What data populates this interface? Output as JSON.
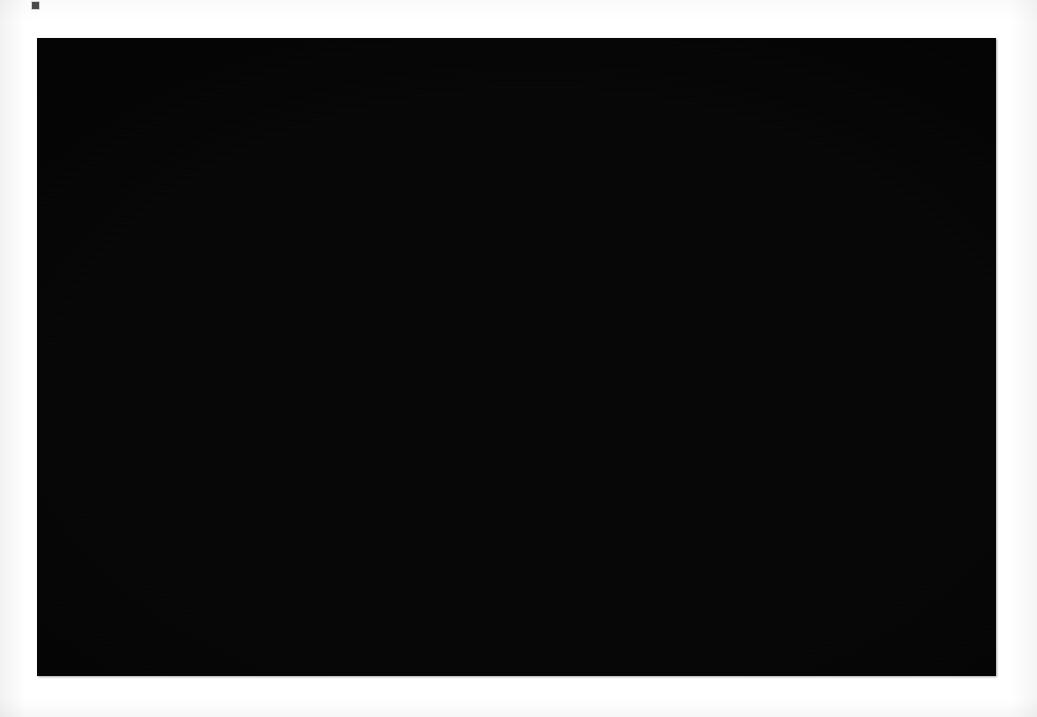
{
  "figure": {
    "domain": "chart",
    "kind": "3d-network-flow-map",
    "caption": "",
    "panel": {
      "background_color": "#050505",
      "page_background_color": "#ffffff",
      "left": 37,
      "top": 38,
      "width": 959,
      "height": 638
    },
    "palette": {
      "background": "#050505",
      "landmass_top": "#1d1d1d",
      "landmass_side_light": "#e6e6e6",
      "landmass_side_mid": "#b4b4b4",
      "landmass_side_dark": "#6e6e6e",
      "arc_bright": "#f2f2f2",
      "arc_mid": "#b8b8b8",
      "arc_faint": "#7a7a7a",
      "node_city": "#ffffff",
      "node_apex": "#9a9a9a"
    },
    "elements": {
      "basemap_label": "Extruded 3D map of the United States (lower 48, Alaska, Hawaii)",
      "spikes_label": "Vertical hub spikes rising from major cities",
      "arcs_label": "Top-level arcs connecting hub apexes",
      "ground_links_label": "Ground-level links between city nodes",
      "cities_label": "City node markers"
    }
  },
  "chart_data": {
    "type": "scatter",
    "title": "",
    "subtitle": "",
    "xlabel": "",
    "ylabel": "",
    "legend": [],
    "grid": false,
    "projection": "isometric-3d, viewed from above-south, vertical axis = traffic volume",
    "landmass_outline_conus": [
      [
        265,
        393
      ],
      [
        282,
        387
      ],
      [
        300,
        383
      ],
      [
        322,
        381
      ],
      [
        348,
        379
      ],
      [
        372,
        377
      ],
      [
        400,
        374
      ],
      [
        432,
        371
      ],
      [
        468,
        367
      ],
      [
        505,
        364
      ],
      [
        548,
        361
      ],
      [
        592,
        358
      ],
      [
        636,
        356
      ],
      [
        678,
        354
      ],
      [
        716,
        353
      ],
      [
        752,
        352
      ],
      [
        786,
        352
      ],
      [
        818,
        354
      ],
      [
        846,
        358
      ],
      [
        872,
        364
      ],
      [
        894,
        372
      ],
      [
        912,
        382
      ],
      [
        924,
        393
      ],
      [
        930,
        404
      ],
      [
        934,
        416
      ],
      [
        930,
        428
      ],
      [
        921,
        438
      ],
      [
        910,
        447
      ],
      [
        898,
        455
      ],
      [
        886,
        462
      ],
      [
        874,
        468
      ],
      [
        862,
        474
      ],
      [
        852,
        480
      ],
      [
        845,
        489
      ],
      [
        840,
        500
      ],
      [
        836,
        512
      ],
      [
        832,
        524
      ],
      [
        826,
        536
      ],
      [
        818,
        546
      ],
      [
        808,
        553
      ],
      [
        796,
        559
      ],
      [
        786,
        567
      ],
      [
        780,
        578
      ],
      [
        776,
        592
      ],
      [
        772,
        606
      ],
      [
        766,
        618
      ],
      [
        758,
        626
      ],
      [
        748,
        628
      ],
      [
        740,
        620
      ],
      [
        736,
        606
      ],
      [
        734,
        590
      ],
      [
        730,
        574
      ],
      [
        724,
        560
      ],
      [
        716,
        548
      ],
      [
        706,
        538
      ],
      [
        694,
        530
      ],
      [
        680,
        524
      ],
      [
        664,
        520
      ],
      [
        648,
        518
      ],
      [
        632,
        518
      ],
      [
        616,
        520
      ],
      [
        600,
        523
      ],
      [
        586,
        527
      ],
      [
        572,
        530
      ],
      [
        560,
        530
      ],
      [
        548,
        527
      ],
      [
        538,
        521
      ],
      [
        528,
        514
      ],
      [
        518,
        508
      ],
      [
        506,
        504
      ],
      [
        494,
        502
      ],
      [
        482,
        503
      ],
      [
        470,
        506
      ],
      [
        458,
        511
      ],
      [
        446,
        517
      ],
      [
        434,
        523
      ],
      [
        422,
        528
      ],
      [
        410,
        530
      ],
      [
        398,
        529
      ],
      [
        388,
        524
      ],
      [
        380,
        516
      ],
      [
        374,
        506
      ],
      [
        370,
        494
      ],
      [
        366,
        482
      ],
      [
        360,
        470
      ],
      [
        352,
        460
      ],
      [
        342,
        452
      ],
      [
        330,
        446
      ],
      [
        318,
        440
      ],
      [
        306,
        434
      ],
      [
        294,
        426
      ],
      [
        284,
        418
      ],
      [
        276,
        408
      ],
      [
        268,
        400
      ]
    ],
    "landmass_outline_alaska": [
      [
        152,
        452
      ],
      [
        163,
        445
      ],
      [
        176,
        441
      ],
      [
        190,
        438
      ],
      [
        204,
        436
      ],
      [
        218,
        436
      ],
      [
        230,
        438
      ],
      [
        238,
        443
      ],
      [
        242,
        450
      ],
      [
        248,
        456
      ],
      [
        256,
        458
      ],
      [
        264,
        460
      ],
      [
        270,
        465
      ],
      [
        272,
        473
      ],
      [
        268,
        480
      ],
      [
        260,
        486
      ],
      [
        250,
        490
      ],
      [
        240,
        493
      ],
      [
        228,
        496
      ],
      [
        214,
        499
      ],
      [
        200,
        502
      ],
      [
        186,
        504
      ],
      [
        172,
        505
      ],
      [
        160,
        504
      ],
      [
        150,
        501
      ],
      [
        142,
        496
      ],
      [
        136,
        490
      ],
      [
        132,
        483
      ],
      [
        132,
        476
      ],
      [
        136,
        469
      ],
      [
        142,
        462
      ],
      [
        148,
        456
      ]
    ],
    "landmass_outline_alaska_tail": [
      [
        62,
        512
      ],
      [
        76,
        506
      ],
      [
        92,
        502
      ],
      [
        108,
        500
      ],
      [
        124,
        499
      ],
      [
        138,
        500
      ],
      [
        150,
        503
      ],
      [
        158,
        508
      ],
      [
        160,
        514
      ],
      [
        154,
        519
      ],
      [
        142,
        522
      ],
      [
        126,
        524
      ],
      [
        110,
        526
      ],
      [
        94,
        527
      ],
      [
        80,
        527
      ],
      [
        70,
        525
      ],
      [
        62,
        520
      ]
    ],
    "landmass_outline_hawaii": [
      [
        [
          258,
          487
        ],
        [
          266,
          485
        ],
        [
          272,
          489
        ],
        [
          270,
          496
        ],
        [
          262,
          499
        ],
        [
          256,
          495
        ]
      ],
      [
        [
          282,
          506
        ],
        [
          292,
          503
        ],
        [
          299,
          508
        ],
        [
          297,
          517
        ],
        [
          288,
          521
        ],
        [
          280,
          516
        ]
      ],
      [
        [
          296,
          527
        ],
        [
          306,
          524
        ],
        [
          314,
          530
        ],
        [
          312,
          540
        ],
        [
          302,
          544
        ],
        [
          294,
          538
        ]
      ],
      [
        [
          282,
          545
        ],
        [
          300,
          541
        ],
        [
          312,
          548
        ],
        [
          316,
          562
        ],
        [
          308,
          576
        ],
        [
          292,
          580
        ],
        [
          280,
          572
        ],
        [
          276,
          558
        ]
      ]
    ],
    "hub_spikes": [
      {
        "name": "hub-1",
        "base": [
          330,
          405
        ],
        "apex": [
          330,
          52
        ],
        "height": 353,
        "rank": 1
      },
      {
        "name": "hub-2",
        "base": [
          190,
          420
        ],
        "apex": [
          190,
          103
        ],
        "height": 317,
        "rank": 2
      },
      {
        "name": "hub-3",
        "base": [
          172,
          430
        ],
        "apex": [
          172,
          148
        ],
        "height": 282,
        "rank": 3
      },
      {
        "name": "hub-4",
        "base": [
          434,
          392
        ],
        "apex": [
          434,
          146
        ],
        "height": 246,
        "rank": 4
      },
      {
        "name": "hub-5",
        "base": [
          560,
          382
        ],
        "apex": [
          560,
          170
        ],
        "height": 212,
        "rank": 5
      },
      {
        "name": "hub-6",
        "base": [
          690,
          375
        ],
        "apex": [
          690,
          180
        ],
        "height": 195,
        "rank": 6
      },
      {
        "name": "hub-7",
        "base": [
          772,
          376
        ],
        "apex": [
          772,
          182
        ],
        "height": 194,
        "rank": 7
      },
      {
        "name": "hub-8",
        "base": [
          836,
          380
        ],
        "apex": [
          836,
          194
        ],
        "height": 186,
        "rank": 8
      },
      {
        "name": "hub-9",
        "base": [
          886,
          386
        ],
        "apex": [
          886,
          190
        ],
        "height": 196,
        "rank": 9
      },
      {
        "name": "hub-10",
        "base": [
          930,
          396
        ],
        "apex": [
          930,
          196
        ],
        "height": 200,
        "rank": 10
      },
      {
        "name": "hub-11",
        "base": [
          740,
          392
        ],
        "apex": [
          740,
          246
        ],
        "height": 146,
        "rank": 11
      },
      {
        "name": "hub-12",
        "base": [
          490,
          400
        ],
        "apex": [
          490,
          250
        ],
        "height": 150,
        "rank": 12
      },
      {
        "name": "hub-13",
        "base": [
          905,
          404
        ],
        "apex": [
          905,
          218
        ],
        "height": 186,
        "rank": 13
      },
      {
        "name": "hub-14",
        "base": [
          862,
          392
        ],
        "apex": [
          862,
          214
        ],
        "height": 178,
        "rank": 14
      }
    ],
    "apex_arcs": [
      [
        1,
        0
      ],
      [
        0,
        3
      ],
      [
        0,
        4
      ],
      [
        0,
        5
      ],
      [
        0,
        6
      ],
      [
        0,
        9
      ],
      [
        1,
        2
      ],
      [
        2,
        3
      ],
      [
        3,
        4
      ],
      [
        4,
        5
      ],
      [
        5,
        6
      ],
      [
        6,
        7
      ],
      [
        7,
        8
      ],
      [
        8,
        9
      ],
      [
        2,
        4
      ],
      [
        1,
        3
      ],
      [
        3,
        11
      ],
      [
        4,
        11
      ],
      [
        5,
        11
      ],
      [
        6,
        11
      ],
      [
        10,
        5
      ],
      [
        10,
        6
      ],
      [
        10,
        7
      ],
      [
        10,
        9
      ],
      [
        2,
        10
      ],
      [
        11,
        13
      ],
      [
        11,
        12
      ],
      [
        12,
        8
      ],
      [
        12,
        9
      ],
      [
        13,
        9
      ],
      [
        0,
        2
      ],
      [
        1,
        4
      ],
      [
        2,
        11
      ],
      [
        3,
        10
      ],
      [
        9,
        13
      ],
      [
        7,
        12
      ],
      [
        6,
        12
      ],
      [
        5,
        12
      ],
      [
        0,
        10
      ],
      [
        2,
        9
      ]
    ],
    "city_nodes_count": 214,
    "ground_link_count": 420,
    "value_range": [
      0,
      1
    ],
    "axis_ranges": {
      "x": [
        0,
        959
      ],
      "y": [
        0,
        638
      ]
    }
  }
}
